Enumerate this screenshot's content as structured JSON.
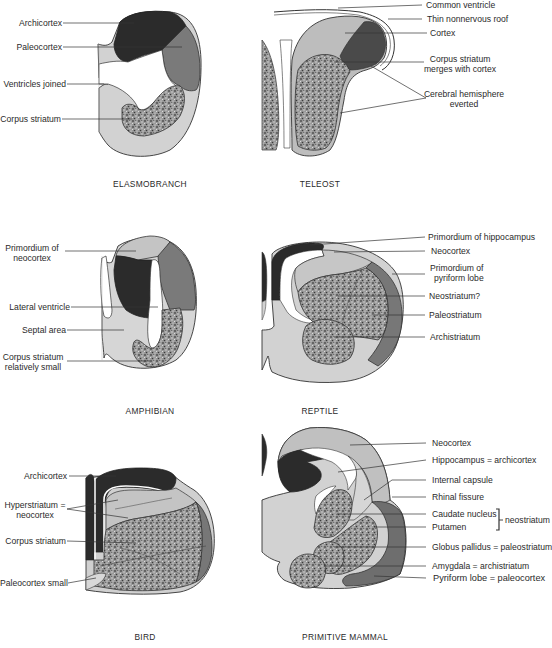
{
  "figure": {
    "colors": {
      "dark": "#2b2b2b",
      "mid": "#777777",
      "light": "#cfcfcf",
      "lightest": "#e4e4e4",
      "stipple": "#8a8a8a",
      "line": "#333333"
    },
    "panels": [
      {
        "id": "elasmobranch",
        "caption": "ELASMOBRANCH",
        "labels": [
          "Archicortex",
          "Paleocortex",
          "Ventricles joined",
          "Corpus striatum"
        ]
      },
      {
        "id": "teleost",
        "caption": "TELEOST",
        "labels": [
          "Common ventricle",
          "Thin nonnervous roof",
          "Cortex",
          "Corpus striatum",
          "merges with cortex",
          "Cerebral hemisphere",
          "everted"
        ]
      },
      {
        "id": "amphibian",
        "caption": "AMPHIBIAN",
        "labels": [
          "Primordium of",
          "neocortex",
          "Lateral ventricle",
          "Septal area",
          "Corpus striatum",
          "relatively small"
        ]
      },
      {
        "id": "reptile",
        "caption": "REPTILE",
        "labels": [
          "Primordium of hippocampus",
          "Neocortex",
          "Primordium of",
          "pyriform lobe",
          "Neostriatum?",
          "Paleostriatum",
          "Archistriatum"
        ]
      },
      {
        "id": "bird",
        "caption": "BIRD",
        "labels": [
          "Archicortex",
          "Hyperstriatum =",
          "neocortex",
          "Corpus striatum",
          "Paleocortex small"
        ]
      },
      {
        "id": "primitive-mammal",
        "caption": "PRIMITIVE MAMMAL",
        "labels": [
          "Neocortex",
          "Hippocampus = archicortex",
          "Internal capsule",
          "Rhinal fissure",
          "Caudate nucleus",
          "Putamen",
          "neostriatum",
          "Globus pallidus = paleostriatum",
          "Amygdala = archistriatum",
          "Pyriform lobe = paleocortex"
        ]
      }
    ]
  }
}
